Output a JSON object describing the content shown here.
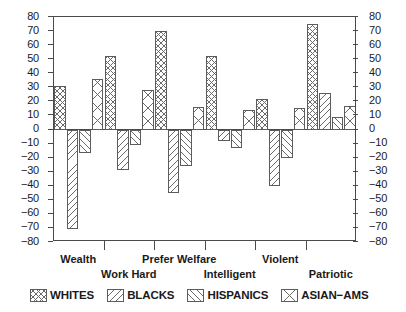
{
  "chart_data": {
    "type": "bar",
    "title": "",
    "subtitle": "",
    "xlabel": "",
    "ylabel": "",
    "ylim": [
      -80,
      80
    ],
    "ytick_step": 10,
    "grid": false,
    "legend_position": "bottom",
    "orientation": "vertical",
    "axis_note": "Mirrored numeric scale shown on both left and right sides",
    "categories": [
      "Wealth",
      "Work Hard",
      "Prefer Welfare",
      "Intelligent",
      "Violent",
      "Patriotic"
    ],
    "ytick_labels": [
      "80",
      "70",
      "60",
      "50",
      "40",
      "30",
      "20",
      "10",
      "0",
      "-10",
      "-20",
      "-30",
      "-40",
      "-50",
      "-60",
      "-70",
      "-80"
    ],
    "ytick_values": [
      80,
      70,
      60,
      50,
      40,
      30,
      20,
      10,
      0,
      -10,
      -20,
      -30,
      -40,
      -50,
      -60,
      -70,
      -80
    ],
    "series": [
      {
        "name": "WHITES",
        "pattern": "cross-hatch",
        "values": [
          31,
          52,
          70,
          52,
          22,
          75
        ]
      },
      {
        "name": "BLACKS",
        "pattern": "diagonal-down",
        "values": [
          -71,
          -29,
          -45,
          -8,
          -40,
          26
        ]
      },
      {
        "name": "HISPANICS",
        "pattern": "diagonal-up",
        "values": [
          -17,
          -11,
          -26,
          -13,
          -20,
          9
        ]
      },
      {
        "name": "ASIAN-AMS",
        "pattern": "open-cross",
        "values": [
          36,
          28,
          16,
          14,
          15,
          17
        ]
      }
    ]
  },
  "legend": {
    "items": [
      {
        "label": "WHITES",
        "pattern": "cross-hatch"
      },
      {
        "label": "BLACKS",
        "pattern": "diagonal-down"
      },
      {
        "label": "HISPANICS",
        "pattern": "diagonal-up"
      },
      {
        "label": "ASIAN-AMS",
        "pattern": "open-cross"
      }
    ]
  }
}
